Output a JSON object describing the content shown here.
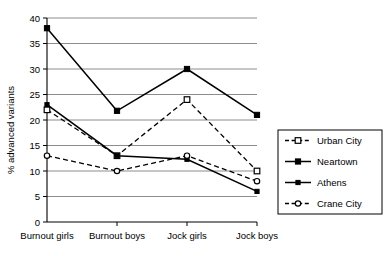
{
  "chart_data": {
    "type": "line",
    "title": "",
    "subtitle": "",
    "xlabel": "",
    "ylabel": "% advanced variants",
    "categories": [
      "Burnout girls",
      "Burnout boys",
      "Jock girls",
      "Jock boys"
    ],
    "ylim": [
      0,
      40
    ],
    "yticks": [
      0,
      5,
      10,
      15,
      20,
      25,
      30,
      35,
      40
    ],
    "ytick_labels": [
      "0",
      "5",
      "10",
      "15",
      "20",
      "25",
      "30",
      "35",
      "40"
    ],
    "grid": "horizontal",
    "legend_position": "right",
    "series": [
      {
        "name": "Urban City",
        "values": [
          22,
          13,
          24,
          10
        ],
        "line_style": "dashed",
        "marker": "open-square",
        "color": "#000000"
      },
      {
        "name": "Neartown",
        "values": [
          38,
          21.8,
          30,
          21
        ],
        "line_style": "solid",
        "marker": "filled-square",
        "color": "#000000"
      },
      {
        "name": "Athens",
        "values": [
          23,
          13,
          12.3,
          6
        ],
        "line_style": "solid",
        "marker": "filled-square-small",
        "color": "#000000"
      },
      {
        "name": "Crane City",
        "values": [
          13,
          10,
          13,
          8
        ],
        "line_style": "dashed",
        "marker": "open-circle",
        "color": "#000000"
      }
    ]
  },
  "legend": {
    "items": [
      {
        "label": "Urban City"
      },
      {
        "label": "Neartown"
      },
      {
        "label": "Athens"
      },
      {
        "label": "Crane City"
      }
    ]
  },
  "colors": {
    "axis": "#000000",
    "grid": "#808080",
    "series": "#000000",
    "background": "#ffffff"
  }
}
